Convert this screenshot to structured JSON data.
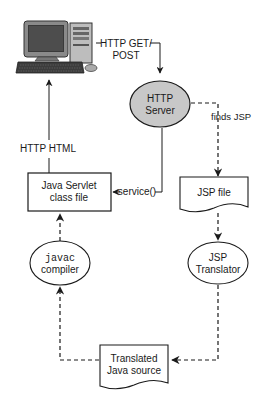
{
  "diagram": {
    "nodes": {
      "client": {
        "label": "Client computer",
        "icon": "computer-icon"
      },
      "http_server": {
        "line1": "HTTP",
        "line2": "Server"
      },
      "jsp_file": {
        "label": "JSP file"
      },
      "jsp_translator": {
        "line1": "JSP",
        "line2": "Translator"
      },
      "translated_source": {
        "line1": "Translated",
        "line2": "Java source"
      },
      "javac": {
        "line1": "javac",
        "line2": "compiler"
      },
      "servlet_class": {
        "line1": "Java Servlet",
        "line2": "class file"
      }
    },
    "edges": {
      "request": {
        "line1": "HTTP GET/",
        "line2": "POST"
      },
      "finds_jsp": {
        "label": "finds JSP"
      },
      "service": {
        "label": "service()"
      },
      "response": {
        "label": "HTTP HTML"
      }
    },
    "colors": {
      "stroke": "#1a1a1a",
      "server_fill": "#c8c8c8",
      "background": "#ffffff"
    }
  }
}
